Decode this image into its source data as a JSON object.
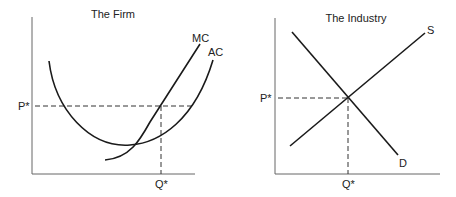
{
  "panels": [
    {
      "title": "The Firm",
      "y_label": "P*",
      "x_label": "Q*",
      "curves": [
        {
          "name": "MC",
          "label": "MC"
        },
        {
          "name": "AC",
          "label": "AC"
        }
      ]
    },
    {
      "title": "The Industry",
      "y_label": "P*",
      "x_label": "Q*",
      "curves": [
        {
          "name": "S",
          "label": "S"
        },
        {
          "name": "D",
          "label": "D"
        }
      ]
    }
  ],
  "colors": {
    "line": "#1a1a1a",
    "axis": "#555555",
    "background": "#ffffff"
  }
}
